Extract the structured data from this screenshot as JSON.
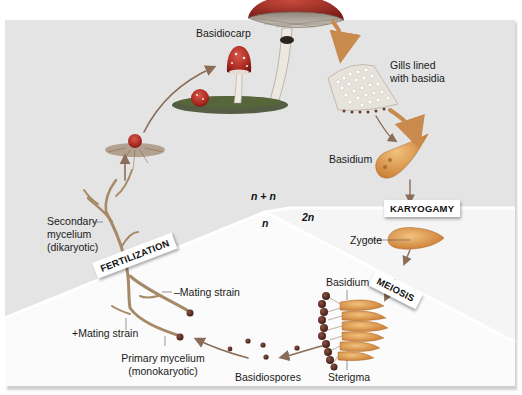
{
  "diagram": {
    "regions": {
      "dikaryotic": {
        "label": "n + n",
        "color": "#e4e4e4"
      },
      "haploid": {
        "label": "n",
        "color": "#fbfbfb"
      },
      "diploid": {
        "label": "2n",
        "color": "#f6f6f6"
      }
    },
    "stages": {
      "fertilization": "FERTILIZATION",
      "karyogamy": "KARYOGAMY",
      "meiosis": "MEIOSIS"
    },
    "labels": {
      "basidiocarp": "Basidiocarp",
      "gills_line1": "Gills lined",
      "gills_line2": "with basidia",
      "basidium_top": "Basidium",
      "zygote": "Zygote",
      "basidium_bottom": "Basidium",
      "sterigma": "Sterigma",
      "basidiospores": "Basidiospores",
      "primary_line1": "Primary mycelium",
      "primary_line2": "(monokaryotic)",
      "plus_mating": "+Mating strain",
      "minus_mating": "–Mating strain",
      "secondary_line1": "Secondary",
      "secondary_line2": "mycelium",
      "secondary_line3": "(dikaryotic)"
    },
    "colors": {
      "arrow": "#c98a4e",
      "arrow_gray": "#8a8a8a",
      "cap_red": "#b8302a",
      "cap_spot": "#f3e9e2",
      "stalk": "#e8e4dc",
      "grass": "#3f4a2e",
      "mycelium": "#a68a68",
      "basidium": "#d99a55",
      "spore": "#5a2e22",
      "gill": "#bdb3a6"
    }
  }
}
